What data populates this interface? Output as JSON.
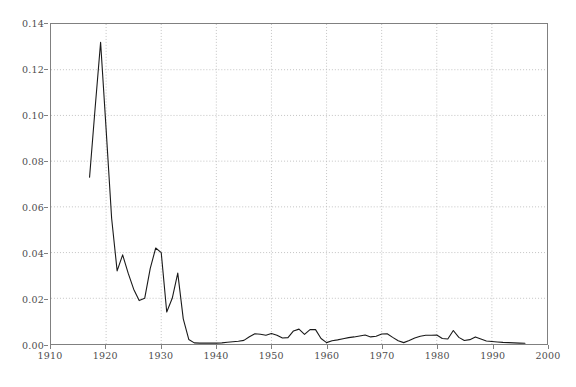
{
  "chart_data": {
    "type": "line",
    "title": "",
    "subtitle": "",
    "xlabel": "",
    "ylabel": "",
    "xlim": [
      1910,
      2000
    ],
    "ylim": [
      0.0,
      0.14
    ],
    "xticks": [
      1910,
      1920,
      1930,
      1940,
      1950,
      1960,
      1970,
      1980,
      1990,
      2000
    ],
    "xtick_labels": [
      "1910",
      "1920",
      "1930",
      "1940",
      "1950",
      "1960",
      "1970",
      "1980",
      "1990",
      "2000"
    ],
    "yticks": [
      0.0,
      0.02,
      0.04,
      0.06,
      0.08,
      0.1,
      0.12,
      0.14
    ],
    "ytick_labels": [
      "0.00",
      "0.02",
      "0.04",
      "0.06",
      "0.08",
      "0.10",
      "0.12",
      "0.14"
    ],
    "grid": true,
    "grid_style": "dotted",
    "legend": "none",
    "annotations": [],
    "series": [
      {
        "name": "series-1",
        "color": "#1a1a1a",
        "line_width": 1.1,
        "x": [
          1917,
          1918,
          1919,
          1920,
          1921,
          1922,
          1923,
          1924,
          1925,
          1926,
          1927,
          1928,
          1929,
          1930,
          1931,
          1932,
          1933,
          1934,
          1935,
          1936,
          1937,
          1938,
          1939,
          1940,
          1941,
          1942,
          1943,
          1944,
          1945,
          1946,
          1947,
          1948,
          1949,
          1950,
          1951,
          1952,
          1953,
          1954,
          1955,
          1956,
          1957,
          1958,
          1959,
          1960,
          1961,
          1962,
          1963,
          1964,
          1965,
          1966,
          1967,
          1968,
          1969,
          1970,
          1971,
          1972,
          1973,
          1974,
          1975,
          1976,
          1977,
          1978,
          1979,
          1980,
          1981,
          1982,
          1983,
          1984,
          1985,
          1986,
          1987,
          1988,
          1989,
          1990,
          1991,
          1992,
          1993,
          1994,
          1995,
          1996
        ],
        "y": [
          0.073,
          0.103,
          0.132,
          0.094,
          0.055,
          0.032,
          0.039,
          0.031,
          0.024,
          0.019,
          0.02,
          0.033,
          0.042,
          0.04,
          0.014,
          0.02,
          0.031,
          0.011,
          0.002,
          0.0005,
          0.0004,
          0.0004,
          0.0004,
          0.0004,
          0.0005,
          0.0008,
          0.001,
          0.0012,
          0.0016,
          0.0032,
          0.0045,
          0.0043,
          0.0038,
          0.0046,
          0.0038,
          0.0026,
          0.0028,
          0.0057,
          0.0065,
          0.0042,
          0.0063,
          0.0063,
          0.0024,
          0.0006,
          0.0014,
          0.0018,
          0.0023,
          0.0028,
          0.0031,
          0.0035,
          0.0039,
          0.0031,
          0.0034,
          0.0044,
          0.0045,
          0.0029,
          0.0014,
          0.0006,
          0.0015,
          0.0026,
          0.0034,
          0.0038,
          0.0038,
          0.0039,
          0.0024,
          0.0022,
          0.0059,
          0.0029,
          0.0015,
          0.0019,
          0.0031,
          0.0022,
          0.0013,
          0.0011,
          0.0009,
          0.0007,
          0.0006,
          0.0005,
          0.0004,
          0.0003
        ]
      }
    ]
  }
}
